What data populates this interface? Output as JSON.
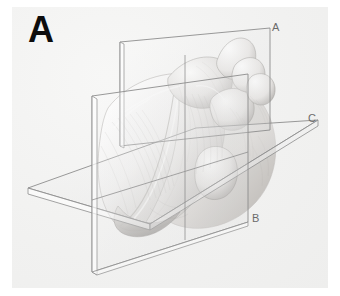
{
  "figure": {
    "panel_letter": "A",
    "caption_hint": "",
    "background_color": "#f2f2f1",
    "line_color": "#8d8d8d",
    "ink_color": "#4a4a4a"
  },
  "subject": {
    "name": "heart-anatomical-illustration",
    "style": "pencil-shaded line drawing",
    "description": "Human heart shown in three-quarter anterior view, intersected by three orthogonal sectioning planes"
  },
  "planes": [
    {
      "id": "A",
      "label": "A",
      "name": "sagittal-section-plane",
      "orientation": "vertical",
      "label_position": {
        "x": 272,
        "y": 22
      }
    },
    {
      "id": "B",
      "label": "B",
      "name": "coronal-section-plane",
      "orientation": "vertical",
      "label_position": {
        "x": 252,
        "y": 213
      }
    },
    {
      "id": "C",
      "label": "C",
      "name": "transverse-section-plane",
      "orientation": "horizontal",
      "label_position": {
        "x": 308,
        "y": 113
      }
    }
  ]
}
